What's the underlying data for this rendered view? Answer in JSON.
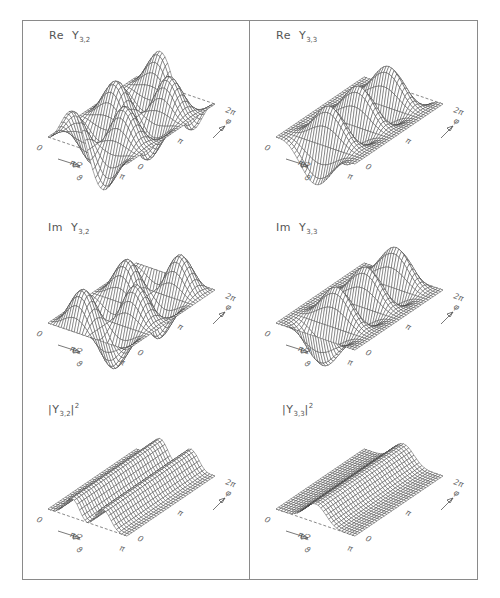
{
  "figure": {
    "frame_color": "#8a8a8a",
    "wire_color": "#3a3a3a",
    "panels": [
      {
        "id": "re-y32",
        "title": {
          "prefix": "Re",
          "symbol": "Y",
          "sub": "3,2",
          "sup": ""
        },
        "fn": "re",
        "l": 3,
        "m": 2
      },
      {
        "id": "re-y33",
        "title": {
          "prefix": "Re",
          "symbol": "Y",
          "sub": "3,3",
          "sup": ""
        },
        "fn": "re",
        "l": 3,
        "m": 3
      },
      {
        "id": "im-y32",
        "title": {
          "prefix": "Im",
          "symbol": "Y",
          "sub": "3,2",
          "sup": ""
        },
        "fn": "im",
        "l": 3,
        "m": 2
      },
      {
        "id": "im-y33",
        "title": {
          "prefix": "Im",
          "symbol": "Y",
          "sub": "3,3",
          "sup": ""
        },
        "fn": "im",
        "l": 3,
        "m": 3
      },
      {
        "id": "abs2-y32",
        "title": {
          "prefix": "|",
          "symbol": "Y",
          "sub": "3,2",
          "sup": "2",
          "suffix": "|"
        },
        "fn": "abs2",
        "l": 3,
        "m": 2
      },
      {
        "id": "abs2-y33",
        "title": {
          "prefix": "|",
          "symbol": "Y",
          "sub": "3,3",
          "sup": "2",
          "suffix": "|"
        },
        "fn": "abs2",
        "l": 3,
        "m": 3
      }
    ],
    "axis_labels": {
      "theta_start": "0",
      "theta_mid": "π/2",
      "theta_end": "π",
      "theta_symbol": "ϑ",
      "phi_start": "0",
      "phi_mid": "π",
      "phi_end": "2π",
      "phi_symbol": "φ"
    }
  },
  "chart_data": {
    "type": "surface-wireframe",
    "grid": {
      "theta_range": [
        0,
        3.14159
      ],
      "phi_range": [
        0,
        6.28318
      ]
    },
    "panels": [
      {
        "label": "Re Y_{3,2}",
        "function": "Re Y_{3,2}(θ,φ) ∝ sin²θ cosθ cos(2φ)",
        "position": "row1-left"
      },
      {
        "label": "Re Y_{3,3}",
        "function": "Re Y_{3,3}(θ,φ) ∝ -sin³θ cos(3φ)",
        "position": "row1-right"
      },
      {
        "label": "Im Y_{3,2}",
        "function": "Im Y_{3,2}(θ,φ) ∝ sin²θ cosθ sin(2φ)",
        "position": "row2-left"
      },
      {
        "label": "Im Y_{3,3}",
        "function": "Im Y_{3,3}(θ,φ) ∝ -sin³θ sin(3φ)",
        "position": "row2-right"
      },
      {
        "label": "|Y_{3,2}|²",
        "function": "|Y_{3,2}|² ∝ sin⁴θ cos²θ (independent of φ)",
        "position": "row3-left"
      },
      {
        "label": "|Y_{3,3}|²",
        "function": "|Y_{3,3}|² ∝ sin⁶θ (independent of φ)",
        "position": "row3-right"
      }
    ],
    "x_axis": {
      "name": "ϑ",
      "ticks": [
        "0",
        "π/2",
        "π"
      ]
    },
    "y_axis": {
      "name": "φ",
      "ticks": [
        "0",
        "π",
        "2π"
      ]
    }
  }
}
